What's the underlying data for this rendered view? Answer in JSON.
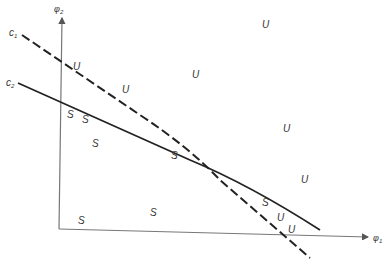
{
  "diagram": {
    "type": "stability-region-plot",
    "axes": {
      "x": {
        "label": "φ",
        "subscript": "1"
      },
      "y": {
        "label": "φ",
        "subscript": "2"
      }
    },
    "curves": [
      {
        "id": "c1",
        "label": "c",
        "subscript": "1",
        "style": "dashed"
      },
      {
        "id": "c2",
        "label": "c",
        "subscript": "2",
        "style": "solid"
      }
    ],
    "region_labels": {
      "unstable": "U",
      "stable": "S"
    },
    "points": [
      {
        "text": "U",
        "x": 73,
        "y": 70
      },
      {
        "text": "U",
        "x": 122,
        "y": 93
      },
      {
        "text": "U",
        "x": 192,
        "y": 78
      },
      {
        "text": "U",
        "x": 262,
        "y": 28
      },
      {
        "text": "U",
        "x": 283,
        "y": 132
      },
      {
        "text": "U",
        "x": 301,
        "y": 183
      },
      {
        "text": "U",
        "x": 277,
        "y": 221
      },
      {
        "text": "U",
        "x": 288,
        "y": 233
      },
      {
        "text": "S",
        "x": 67,
        "y": 118
      },
      {
        "text": "S",
        "x": 82,
        "y": 123
      },
      {
        "text": "S",
        "x": 92,
        "y": 147
      },
      {
        "text": "S",
        "x": 171,
        "y": 159
      },
      {
        "text": "S",
        "x": 262,
        "y": 206
      },
      {
        "text": "S",
        "x": 78,
        "y": 224
      },
      {
        "text": "S",
        "x": 150,
        "y": 216
      }
    ]
  }
}
